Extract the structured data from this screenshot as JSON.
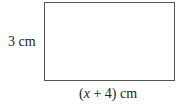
{
  "diagram": {
    "shape": "rectangle",
    "height_label": "3 cm",
    "width_label": {
      "open": "(",
      "variable": "x",
      "rest": " + 4) cm"
    }
  }
}
